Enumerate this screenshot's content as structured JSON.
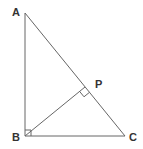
{
  "diagram": {
    "type": "right-triangle-with-altitude",
    "points": {
      "A": {
        "label": "A",
        "x": 25,
        "y": 13
      },
      "B": {
        "label": "B",
        "x": 25,
        "y": 136
      },
      "C": {
        "label": "C",
        "x": 125,
        "y": 136
      },
      "P": {
        "label": "P",
        "x": 85,
        "y": 87
      }
    },
    "segments": [
      "AB",
      "BC",
      "AC",
      "BP"
    ],
    "right_angles": [
      "B",
      "P"
    ],
    "line_color": "#666666"
  }
}
